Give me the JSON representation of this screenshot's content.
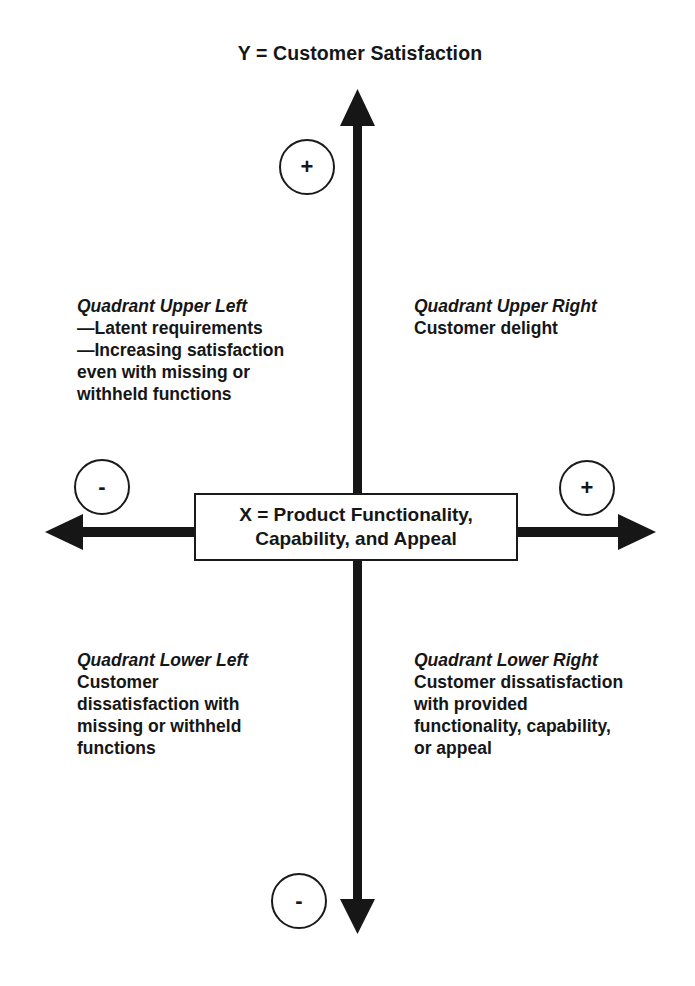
{
  "diagram": {
    "y_axis_label": "Y = Customer Satisfaction",
    "x_axis_label_line1": "X = Product Functionality,",
    "x_axis_label_line2": "Capability, and Appeal",
    "signs": {
      "top": "+",
      "bottom": "-",
      "left": "-",
      "right": "+"
    },
    "quadrants": {
      "upper_left": {
        "title": "Quadrant Upper Left",
        "lines": [
          "—Latent requirements",
          "—Increasing satisfaction",
          "even with missing or",
          "withheld functions"
        ]
      },
      "upper_right": {
        "title": "Quadrant Upper Right",
        "lines": [
          "Customer delight"
        ]
      },
      "lower_left": {
        "title": "Quadrant Lower Left",
        "lines": [
          "Customer",
          "dissatisfaction with",
          "missing or withheld",
          "functions"
        ]
      },
      "lower_right": {
        "title": "Quadrant Lower Right",
        "lines": [
          "Customer dissatisfaction",
          "with provided",
          "functionality, capability,",
          "or appeal"
        ]
      }
    },
    "colors": {
      "ink": "#161616",
      "background": "#ffffff"
    }
  }
}
